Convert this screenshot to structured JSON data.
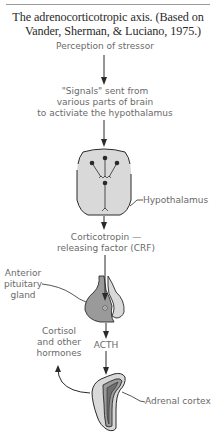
{
  "figure": {
    "caption_line1": "The adrenocorticotropic axis. (Based on",
    "caption_line2": "Vander, Sherman, & Luciano, 1975.)"
  },
  "flow": {
    "step1": "Perception of stressor",
    "step2_line1": "\"Signals\" sent from",
    "step2_line2": "various parts of brain",
    "step2_line3": "to activiate the hypothalamus",
    "step3_line1": "Corticotropin —",
    "step3_line2": "releasing factor (CRF)",
    "step4": "ACTH"
  },
  "labels": {
    "hypothalamus": "Hypothalamus",
    "pituitary_line1": "Anterior",
    "pituitary_line2": "pituitary",
    "pituitary_line3": "gland",
    "cortisol_line1": "Cortisol",
    "cortisol_line2": "and other",
    "cortisol_line3": "hormones",
    "adrenal": "Adrenal cortex"
  },
  "colors": {
    "organ_fill_light": "#d9d9d9",
    "organ_fill_dark": "#9a9a9a",
    "line": "#2a2a2a",
    "label_text": "#6a6a6a"
  }
}
